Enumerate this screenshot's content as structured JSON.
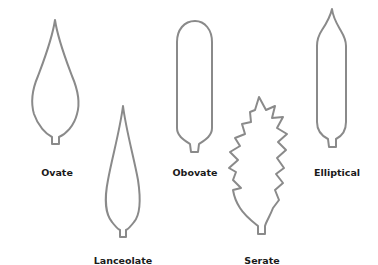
{
  "diagram": {
    "title": "",
    "leaf_shapes": [
      {
        "id": "ovate",
        "label": "Ovate",
        "label_pos": [
          57,
          176
        ]
      },
      {
        "id": "lanceolate",
        "label": "Lanceolate",
        "label_pos": [
          123,
          264
        ]
      },
      {
        "id": "obovate",
        "label": "Obovate",
        "label_pos": [
          195,
          176
        ]
      },
      {
        "id": "serate",
        "label": "Serate",
        "label_pos": [
          262,
          264
        ]
      },
      {
        "id": "elliptical",
        "label": "Elliptical",
        "label_pos": [
          337,
          176
        ]
      }
    ],
    "colors": {
      "outline": "#8a8a8a",
      "fill": "#ffffff",
      "label": "#1a1a1a",
      "background": "#ffffff"
    }
  }
}
